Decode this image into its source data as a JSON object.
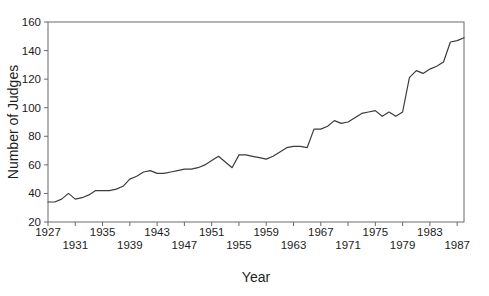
{
  "figure": {
    "background": "#ffffff"
  },
  "chart_data": {
    "type": "line",
    "title": "",
    "xlabel": "Year",
    "ylabel": "Number of Judges",
    "xlim": [
      1927,
      1988
    ],
    "ylim": [
      20,
      160
    ],
    "grid": false,
    "legend": null,
    "line_color": "#3c3c3c",
    "axis_color": "#6b6b6b",
    "yticks": [
      20,
      40,
      60,
      80,
      100,
      120,
      140,
      160
    ],
    "xticks": [
      1927,
      1931,
      1935,
      1939,
      1943,
      1947,
      1951,
      1955,
      1959,
      1963,
      1967,
      1971,
      1975,
      1979,
      1983,
      1987
    ],
    "x": [
      1927,
      1928,
      1929,
      1930,
      1931,
      1932,
      1933,
      1934,
      1935,
      1936,
      1937,
      1938,
      1939,
      1940,
      1941,
      1942,
      1943,
      1944,
      1945,
      1946,
      1947,
      1948,
      1949,
      1950,
      1951,
      1952,
      1953,
      1954,
      1955,
      1956,
      1957,
      1958,
      1959,
      1960,
      1961,
      1962,
      1963,
      1964,
      1965,
      1966,
      1967,
      1968,
      1969,
      1970,
      1971,
      1972,
      1973,
      1974,
      1975,
      1976,
      1977,
      1978,
      1979,
      1980,
      1981,
      1982,
      1983,
      1984,
      1985,
      1986,
      1987,
      1988
    ],
    "values": [
      34,
      34,
      36,
      40,
      36,
      37,
      39,
      42,
      42,
      42,
      43,
      45,
      50,
      52,
      55,
      56,
      54,
      54,
      55,
      56,
      57,
      57,
      58,
      60,
      63,
      66,
      62,
      58,
      67,
      67,
      66,
      65,
      64,
      66,
      69,
      72,
      73,
      73,
      72,
      85,
      85,
      87,
      91,
      89,
      90,
      93,
      96,
      97,
      98,
      94,
      97,
      94,
      97,
      121,
      126,
      124,
      127,
      129,
      132,
      146,
      147,
      149
    ]
  }
}
